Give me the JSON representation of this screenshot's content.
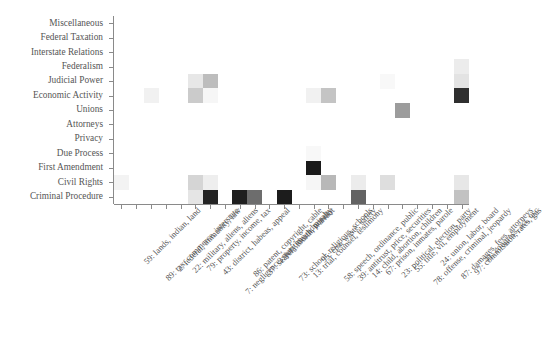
{
  "chart_data": {
    "type": "heatmap",
    "title": "",
    "xlabel": "",
    "ylabel": "",
    "colormap": "greys",
    "grid": false,
    "legend": null,
    "value_range": [
      0,
      1
    ],
    "y_categories": [
      "Miscellaneous",
      "Federal Taxation",
      "Interstate Relations",
      "Federalism",
      "Judicial Power",
      "Economic Activity",
      "Unions",
      "Attorneys",
      "Privacy",
      "Due Process",
      "First Amendment",
      "Civil Rights",
      "Criminal Procedure"
    ],
    "x_categories": [
      "59: lands, indian, land",
      "89: tax, commerce, interstate",
      "2: federal, immunity, law",
      "22: military, aliens, aliens",
      "79: property, income, tax",
      "43: district, habeas, appeal",
      "7: negligence, maritime, admiralty",
      "86: patent, copyright, cable",
      "37: search, fourth, warrant",
      "3: jury, death, penalty",
      "73: school, religious, schools",
      "13: trial, counsel, testimony",
      "95: epa, waste, safety",
      "58: speech, ordinance, public",
      "39: antitrust, price, securities",
      "14: child, abortion, children",
      "67: prison, inmates, parole",
      "23: political, election, party",
      "55: title, vii, employment",
      "78: offense, criminal, jeopardy",
      "24: union, labor, board",
      "87: damages, fees, attorneys",
      "97: commission, rates, gas",
      "41: congress, act, usc"
    ],
    "cells": [
      {
        "row": 5,
        "col": 2,
        "value": 0.06
      },
      {
        "row": 4,
        "col": 5,
        "value": 0.1
      },
      {
        "row": 5,
        "col": 5,
        "value": 0.22
      },
      {
        "row": 4,
        "col": 6,
        "value": 0.28
      },
      {
        "row": 5,
        "col": 6,
        "value": 0.04
      },
      {
        "row": 11,
        "col": 0,
        "value": 0.05
      },
      {
        "row": 11,
        "col": 5,
        "value": 0.18
      },
      {
        "row": 12,
        "col": 5,
        "value": 0.11
      },
      {
        "row": 12,
        "col": 6,
        "value": 0.93
      },
      {
        "row": 11,
        "col": 6,
        "value": 0.07
      },
      {
        "row": 12,
        "col": 8,
        "value": 0.95
      },
      {
        "row": 12,
        "col": 9,
        "value": 0.62
      },
      {
        "row": 12,
        "col": 11,
        "value": 0.96
      },
      {
        "row": 5,
        "col": 13,
        "value": 0.06
      },
      {
        "row": 5,
        "col": 14,
        "value": 0.25
      },
      {
        "row": 10,
        "col": 13,
        "value": 0.97
      },
      {
        "row": 11,
        "col": 13,
        "value": 0.04
      },
      {
        "row": 11,
        "col": 14,
        "value": 0.3
      },
      {
        "row": 9,
        "col": 13,
        "value": 0.03
      },
      {
        "row": 11,
        "col": 16,
        "value": 0.08
      },
      {
        "row": 12,
        "col": 16,
        "value": 0.66
      },
      {
        "row": 4,
        "col": 18,
        "value": 0.03
      },
      {
        "row": 11,
        "col": 18,
        "value": 0.14
      },
      {
        "row": 6,
        "col": 19,
        "value": 0.42
      },
      {
        "row": 3,
        "col": 23,
        "value": 0.08
      },
      {
        "row": 4,
        "col": 23,
        "value": 0.12
      },
      {
        "row": 5,
        "col": 23,
        "value": 0.88
      },
      {
        "row": 11,
        "col": 23,
        "value": 0.1
      },
      {
        "row": 12,
        "col": 23,
        "value": 0.26
      }
    ]
  }
}
